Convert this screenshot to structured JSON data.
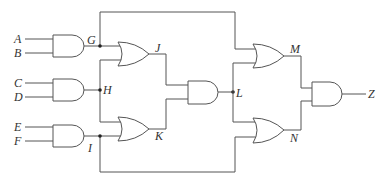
{
  "diagram": {
    "type": "logic-circuit",
    "inputs": [
      "A",
      "B",
      "C",
      "D",
      "E",
      "F"
    ],
    "intermediate": [
      "G",
      "H",
      "I",
      "J",
      "K",
      "L",
      "M",
      "N"
    ],
    "output": "Z",
    "labels": {
      "A": "A",
      "B": "B",
      "C": "C",
      "D": "D",
      "E": "E",
      "F": "F",
      "G": "G",
      "H": "H",
      "I": "I",
      "J": "J",
      "K": "K",
      "L": "L",
      "M": "M",
      "N": "N",
      "Z": "Z"
    },
    "gates": [
      {
        "name": "G",
        "type": "AND",
        "inputs": [
          "A",
          "B"
        ]
      },
      {
        "name": "H",
        "type": "AND",
        "inputs": [
          "C",
          "D"
        ]
      },
      {
        "name": "I",
        "type": "AND",
        "inputs": [
          "E",
          "F"
        ]
      },
      {
        "name": "J",
        "type": "OR",
        "inputs": [
          "G",
          "H"
        ]
      },
      {
        "name": "K",
        "type": "OR",
        "inputs": [
          "H",
          "I"
        ]
      },
      {
        "name": "L",
        "type": "AND",
        "inputs": [
          "J",
          "K"
        ]
      },
      {
        "name": "M",
        "type": "OR",
        "inputs": [
          "G",
          "L"
        ]
      },
      {
        "name": "N",
        "type": "OR",
        "inputs": [
          "L",
          "I"
        ]
      },
      {
        "name": "Z",
        "type": "AND",
        "inputs": [
          "M",
          "N"
        ]
      }
    ],
    "colors": {
      "wire": "#555555",
      "junction": "#222222",
      "text": "#333333"
    }
  }
}
